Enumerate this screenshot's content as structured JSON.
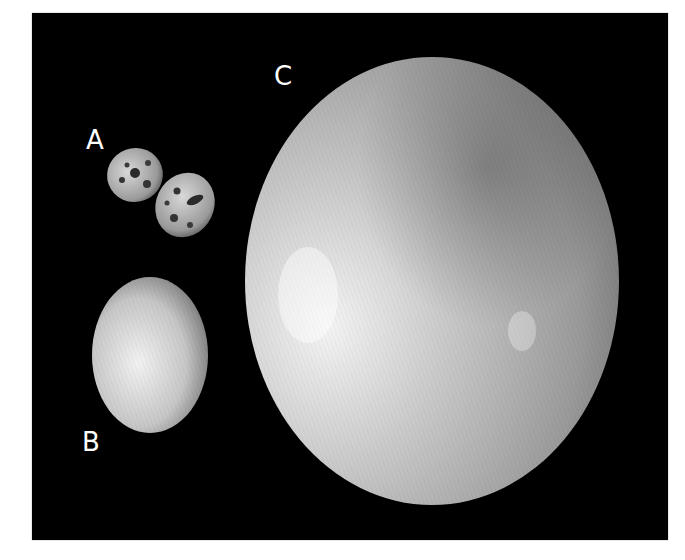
{
  "figure": {
    "background_color": "#000000",
    "eggs": [
      {
        "label": "A",
        "kind": "quail-eggs",
        "count": 2,
        "appearance": "small speckled"
      },
      {
        "label": "B",
        "kind": "chicken-egg",
        "count": 1,
        "appearance": "smooth white"
      },
      {
        "label": "C",
        "kind": "ostrich-egg",
        "count": 1,
        "appearance": "large pitted cream"
      }
    ]
  }
}
